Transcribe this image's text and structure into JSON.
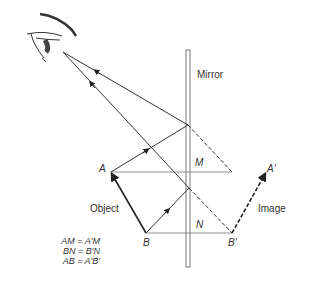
{
  "diagram": {
    "mirror_label": "Mirror",
    "object_label": "Object",
    "image_label": "Image",
    "points": {
      "A": "A",
      "B": "B",
      "M": "M",
      "N": "N",
      "A_prime": "A'",
      "B_prime": "B'"
    },
    "equations": [
      "AM  =  A'M",
      "BN  =  B'N",
      "AB  =  A'B'"
    ],
    "colors": {
      "line": "#333333",
      "thin_line": "#777777",
      "background": "#ffffff"
    }
  }
}
